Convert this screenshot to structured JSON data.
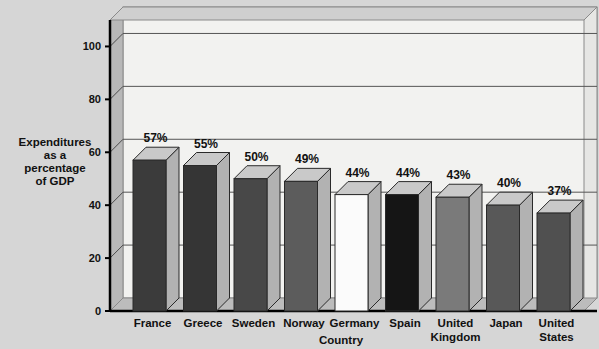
{
  "chart_data": {
    "type": "bar",
    "title": "",
    "xlabel": "Country",
    "ylabel": "Expenditures as a percentage of GDP",
    "ylabel_lines": [
      "Expenditures",
      "as a",
      "percentage",
      "of GDP"
    ],
    "categories": [
      "France",
      "Greece",
      "Sweden",
      "Norway",
      "Germany",
      "Spain",
      "United Kingdom",
      "Japan",
      "United States"
    ],
    "category_lines": [
      [
        "France"
      ],
      [
        "Greece"
      ],
      [
        "Sweden"
      ],
      [
        "Norway"
      ],
      [
        "Germany"
      ],
      [
        "Spain"
      ],
      [
        "United",
        "Kingdom"
      ],
      [
        "Japan"
      ],
      [
        "United",
        "States"
      ]
    ],
    "values": [
      57,
      55,
      50,
      49,
      44,
      44,
      43,
      40,
      37
    ],
    "data_labels": [
      "57%",
      "55%",
      "50%",
      "49%",
      "44%",
      "44%",
      "43%",
      "40%",
      "37%"
    ],
    "bar_colors": [
      "#3b3b3b",
      "#353535",
      "#484848",
      "#5c5c5c",
      "#fbfbfb",
      "#151515",
      "#7a7a7a",
      "#585858",
      "#505050"
    ],
    "ylim": [
      0,
      110
    ],
    "yticks": [
      0,
      20,
      40,
      60,
      80,
      100
    ],
    "ytick_labels": [
      "0",
      "20",
      "40",
      "60",
      "80",
      "100"
    ],
    "grid": true,
    "legend": "none",
    "style": "3d-bar",
    "palette": {
      "background": "#d6d6d6",
      "plot_face": "#f2f2f0",
      "plot_side": "#b8b8b8",
      "floor": "#bcbcbc",
      "axis_line": "#000000",
      "gridline": "#555555",
      "bar_top": "#c9c9c9",
      "bar_side": "#b2b2b2"
    }
  }
}
